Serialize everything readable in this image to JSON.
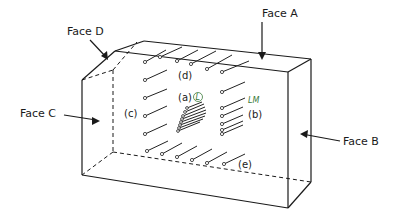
{
  "diagram": {
    "faces": {
      "a": "Face A",
      "b": "Face B",
      "c": "Face C",
      "d": "Face D"
    },
    "groups": {
      "a": "(a)",
      "b": "(b)",
      "c": "(c)",
      "d": "(d)",
      "e": "(e)"
    },
    "annotations": {
      "circled": "L",
      "handwritten": "LM"
    },
    "colors": {
      "ink": "#1a1a1a",
      "annotation": "#3a7a3a"
    }
  }
}
